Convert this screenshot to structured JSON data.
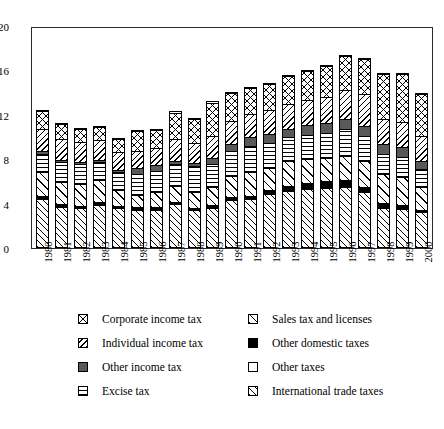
{
  "chart_data": {
    "type": "bar",
    "title": "",
    "subtitle": "",
    "xlabel": "",
    "ylabel": "",
    "stacked": true,
    "grid": false,
    "legend_position": "bottom",
    "ylim": [
      0,
      20
    ],
    "yticks": [
      0,
      4,
      8,
      12,
      16,
      20
    ],
    "ytick_labels": [
      "0",
      "4",
      "8",
      "12",
      "16",
      "20"
    ],
    "categories": [
      "1980",
      "1981",
      "1982",
      "1983",
      "1984",
      "1985",
      "1986",
      "1987",
      "1988",
      "1989",
      "1990",
      "1991",
      "1992",
      "1993",
      "1994",
      "1995",
      "1996",
      "1997",
      "1998",
      "1999",
      "2000"
    ],
    "series": [
      {
        "name": "International trade taxes",
        "pattern": "p-slash",
        "values": [
          4.3,
          3.6,
          3.5,
          3.8,
          3.5,
          3.3,
          3.3,
          3.8,
          3.3,
          3.5,
          4.2,
          4.3,
          4.7,
          5.0,
          5.2,
          5.3,
          5.4,
          4.9,
          3.5,
          3.4,
          3.1
        ]
      },
      {
        "name": "Other domestic taxes",
        "pattern": "p-black",
        "values": [
          0.4,
          0.3,
          0.3,
          0.3,
          0.3,
          0.4,
          0.4,
          0.3,
          0.3,
          0.3,
          0.4,
          0.4,
          0.5,
          0.6,
          0.6,
          0.7,
          0.7,
          0.6,
          0.5,
          0.4,
          0.3
        ]
      },
      {
        "name": "Sales tax and licenses",
        "pattern": "p-slash-light",
        "values": [
          2.2,
          2.1,
          2.0,
          2.0,
          1.4,
          1.1,
          1.3,
          1.5,
          1.4,
          1.7,
          1.9,
          2.1,
          2.0,
          2.2,
          2.2,
          2.1,
          2.2,
          2.3,
          2.7,
          2.6,
          2.1
        ]
      },
      {
        "name": "Excise tax",
        "pattern": "p-horiz",
        "values": [
          1.6,
          1.8,
          1.8,
          1.7,
          1.7,
          1.9,
          2.0,
          2.0,
          2.4,
          2.1,
          2.3,
          2.4,
          2.3,
          2.2,
          2.2,
          2.3,
          2.4,
          2.3,
          1.8,
          1.8,
          1.6
        ]
      },
      {
        "name": "Other income tax",
        "pattern": "p-darkgray",
        "values": [
          0.3,
          0.2,
          0.2,
          0.2,
          0.2,
          0.5,
          0.5,
          0.3,
          0.3,
          0.5,
          0.6,
          0.8,
          0.8,
          0.8,
          0.9,
          0.9,
          1.0,
          0.9,
          0.9,
          0.9,
          0.8
        ]
      },
      {
        "name": "Individual income tax",
        "pattern": "p-backslash",
        "values": [
          2.0,
          1.9,
          1.8,
          1.8,
          1.6,
          1.6,
          1.6,
          2.0,
          1.8,
          2.0,
          2.1,
          2.1,
          2.2,
          2.2,
          2.3,
          2.4,
          2.6,
          2.9,
          2.3,
          2.3,
          2.2
        ]
      },
      {
        "name": "Corporate income tax",
        "pattern": "p-cross",
        "values": [
          1.6,
          1.4,
          1.2,
          1.2,
          1.2,
          1.8,
          1.6,
          2.4,
          2.2,
          3.1,
          2.6,
          2.4,
          2.4,
          2.6,
          2.6,
          2.8,
          3.1,
          3.2,
          4.1,
          4.4,
          3.9
        ]
      }
    ],
    "legend": [
      {
        "label": "Corporate income tax",
        "pattern": "p-cross",
        "column": "left",
        "row": 0
      },
      {
        "label": "Individual income tax",
        "pattern": "p-backslash",
        "column": "left",
        "row": 1
      },
      {
        "label": "Other income tax",
        "pattern": "p-darkgray",
        "column": "left",
        "row": 2
      },
      {
        "label": "Excise tax",
        "pattern": "p-horiz",
        "column": "left",
        "row": 3
      },
      {
        "label": "Sales tax and licenses",
        "pattern": "p-slash-light",
        "column": "right",
        "row": 0
      },
      {
        "label": "Other domestic taxes",
        "pattern": "p-black",
        "column": "right",
        "row": 1
      },
      {
        "label": "Other taxes",
        "pattern": "p-white",
        "column": "right",
        "row": 2
      },
      {
        "label": "International trade taxes",
        "pattern": "p-slash",
        "column": "right",
        "row": 3
      }
    ]
  }
}
